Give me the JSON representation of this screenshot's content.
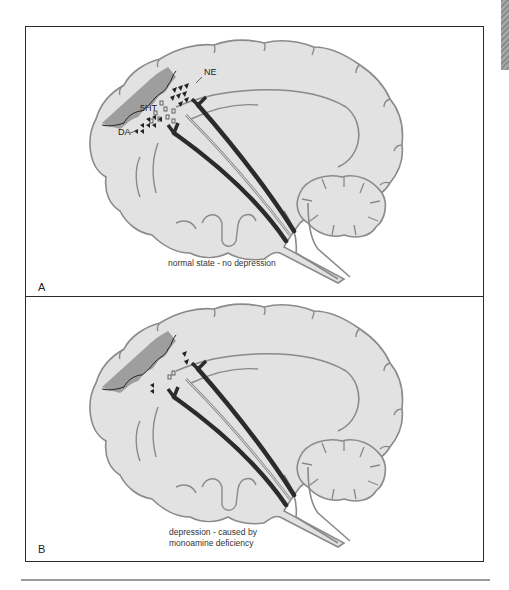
{
  "figure": {
    "panels": [
      {
        "id": "A",
        "letter": "A",
        "caption": "normal state - no depression",
        "neurotransmitter_labels": {
          "ne": "NE",
          "serotonin": "5HT",
          "dopamine": "DA"
        },
        "state": "normal"
      },
      {
        "id": "B",
        "letter": "B",
        "caption_line1": "depression - caused by",
        "caption_line2": "monoamine deficiency",
        "state": "deficient"
      }
    ]
  },
  "colors": {
    "brain_fill": "#e2e2e2",
    "brain_outline": "#8a8a8a",
    "cortex_band": "#9e9e9e",
    "tract_dark": "#2b2b2b",
    "label_text": "#222222",
    "border": "#2a2a2a",
    "rule": "#9a9a9a"
  }
}
